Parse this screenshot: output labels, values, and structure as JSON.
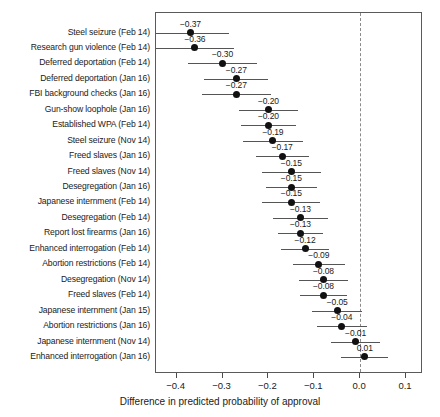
{
  "chart_data": {
    "type": "scatter",
    "title": "",
    "xlabel": "Difference in predicted probability of approval",
    "ylabel": "",
    "xlim": [
      -0.445,
      0.137
    ],
    "xticks": [
      -0.4,
      -0.3,
      -0.2,
      -0.1,
      0.0,
      0.1
    ],
    "xticklabels": [
      "-0.4",
      "-0.3",
      "-0.2",
      "-0.1",
      "0.0",
      "0.1"
    ],
    "grid": false,
    "legend": null,
    "reference_line": {
      "x": 0.0,
      "style": "dashed",
      "color": "#8a8a8a"
    },
    "point_color": "#111111",
    "errorbar_color": "#555555",
    "categories": [
      "Steel seizure (Feb 14)",
      "Research gun violence (Feb 14)",
      "Deferred deportation (Feb 14)",
      "Deferred deportation (Jan 16)",
      "FBI background checks (Jan 16)",
      "Gun-show loophole (Jan 16)",
      "Established WPA (Feb 14)",
      "Steel seizure (Nov 14)",
      "Freed slaves (Jan 16)",
      "Freed slaves (Nov 14)",
      "Desegregation (Jan 16)",
      "Japanese internment (Feb 14)",
      "Desegregation (Feb 14)",
      "Report lost firearms (Jan 16)",
      "Enhanced interrogation (Feb 14)",
      "Abortion restrictions (Feb 14)",
      "Desegregation (Nov 14)",
      "Freed slaves (Feb 14)",
      "Japanese internment (Jan 15)",
      "Abortion restrictions (Jan 16)",
      "Japanese internment (Nov 14)",
      "Enhanced interrogation (Jan 16)"
    ],
    "values": [
      -0.37,
      -0.36,
      -0.3,
      -0.27,
      -0.27,
      -0.2,
      -0.2,
      -0.19,
      -0.17,
      -0.15,
      -0.15,
      -0.15,
      -0.13,
      -0.13,
      -0.12,
      -0.09,
      -0.08,
      -0.08,
      -0.05,
      -0.04,
      -0.01,
      0.01
    ],
    "value_labels": [
      "-0.37",
      "-0.36",
      "-0.30",
      "-0.27",
      "-0.27",
      "-0.20",
      "-0.20",
      "-0.19",
      "-0.17",
      "-0.15",
      "-0.15",
      "-0.15",
      "-0.13",
      "-0.13",
      "-0.12",
      "-0.09",
      "-0.08",
      "-0.08",
      "-0.05",
      "-0.04",
      "-0.01",
      "0.01"
    ],
    "ci_low": [
      -0.455,
      -0.445,
      -0.375,
      -0.34,
      -0.345,
      -0.265,
      -0.26,
      -0.255,
      -0.228,
      -0.215,
      -0.206,
      -0.213,
      -0.189,
      -0.18,
      -0.172,
      -0.146,
      -0.134,
      -0.131,
      -0.104,
      -0.094,
      -0.063,
      -0.041
    ],
    "ci_high": [
      -0.285,
      -0.275,
      -0.225,
      -0.2,
      -0.195,
      -0.135,
      -0.14,
      -0.125,
      -0.112,
      -0.085,
      -0.094,
      -0.087,
      -0.071,
      -0.08,
      -0.068,
      -0.034,
      -0.026,
      -0.029,
      0.004,
      0.014,
      0.043,
      0.061
    ]
  }
}
